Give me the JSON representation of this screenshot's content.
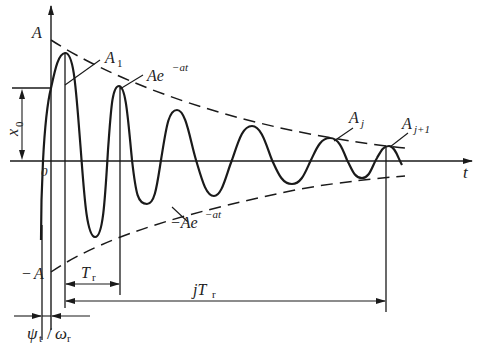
{
  "figure": {
    "type": "damped-oscillation-diagram",
    "colors": {
      "ink": "#1a1a1a",
      "background": "#ffffff"
    }
  },
  "labels": {
    "y_axis_top": "A",
    "y_axis_bottom_sign": "−",
    "y_axis_bottom": "A",
    "x_axis": "t",
    "origin": "0",
    "initial_displacement": "x",
    "initial_displacement_sub": "0",
    "first_peak": "A",
    "first_peak_sub": "1",
    "upper_envelope": "Ae",
    "upper_envelope_exp": "−at",
    "lower_envelope": "−Ae",
    "lower_envelope_exp": "−at",
    "peak_j": "A",
    "peak_j_sub": "j",
    "peak_j1": "A",
    "peak_j1_sub": "j+1",
    "period": "T",
    "period_sub": "r",
    "j_periods_prefix": "jT",
    "j_periods_sub": "r",
    "phase_psi": "ψ",
    "phase_psi_sub": "t",
    "phase_slash": "/",
    "phase_omega": "ω",
    "phase_omega_sub": "r"
  }
}
